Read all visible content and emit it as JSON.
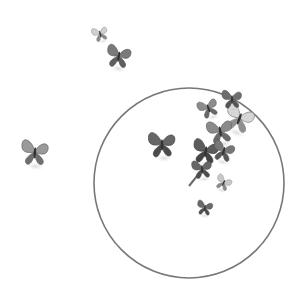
{
  "image": {
    "description": "Grayscale illustration of butterflies flying around and into a thin circle outline",
    "background": "#ffffff",
    "circle": {
      "cx": 189,
      "cy": 183,
      "r": 95,
      "stroke": "#777777",
      "stroke_width": 1.6
    },
    "butterflies": [
      {
        "id": "b1",
        "x": 100,
        "y": 33,
        "scale": 0.55,
        "rotate": -15,
        "fill": "#cfcfcf",
        "shade": "#8a8a8a"
      },
      {
        "id": "b2",
        "x": 119,
        "y": 55,
        "scale": 0.85,
        "rotate": 10,
        "fill": "#7a7a7a",
        "shade": "#5e5e5e"
      },
      {
        "id": "b3",
        "x": 35,
        "y": 151,
        "scale": 0.95,
        "rotate": 5,
        "fill": "#9a9a9a",
        "shade": "#6f6f6f"
      },
      {
        "id": "b4",
        "x": 162,
        "y": 143,
        "scale": 0.95,
        "rotate": 0,
        "fill": "#666666",
        "shade": "#4a4a4a"
      },
      {
        "id": "b5",
        "x": 208,
        "y": 107,
        "scale": 0.7,
        "rotate": -20,
        "fill": "#8c8c8c",
        "shade": "#666666"
      },
      {
        "id": "b6",
        "x": 240,
        "y": 117,
        "scale": 1.0,
        "rotate": 20,
        "fill": "#d6d6d6",
        "shade": "#8f8f8f"
      },
      {
        "id": "b7",
        "x": 232,
        "y": 98,
        "scale": 0.7,
        "rotate": 0,
        "fill": "#6e6e6e",
        "shade": "#555555"
      },
      {
        "id": "b8",
        "x": 220,
        "y": 130,
        "scale": 0.9,
        "rotate": -10,
        "fill": "#8a8a8a",
        "shade": "#6a6a6a"
      },
      {
        "id": "b9",
        "x": 206,
        "y": 150,
        "scale": 0.9,
        "rotate": 10,
        "fill": "#5c5c5c",
        "shade": "#444444"
      },
      {
        "id": "b10",
        "x": 224,
        "y": 150,
        "scale": 0.75,
        "rotate": 15,
        "fill": "#777777",
        "shade": "#595959"
      },
      {
        "id": "b11",
        "x": 202,
        "y": 168,
        "scale": 0.7,
        "rotate": -5,
        "fill": "#666666",
        "shade": "#4d4d4d"
      },
      {
        "id": "b12",
        "x": 224,
        "y": 182,
        "scale": 0.55,
        "rotate": 25,
        "fill": "#c8c8c8",
        "shade": "#8a8a8a"
      },
      {
        "id": "b13",
        "x": 205,
        "y": 207,
        "scale": 0.55,
        "rotate": 10,
        "fill": "#6a6a6a",
        "shade": "#4f4f4f"
      }
    ],
    "stem": {
      "x1": 210,
      "y1": 160,
      "x2": 189,
      "y2": 186,
      "stroke": "#6a6a6a"
    }
  }
}
